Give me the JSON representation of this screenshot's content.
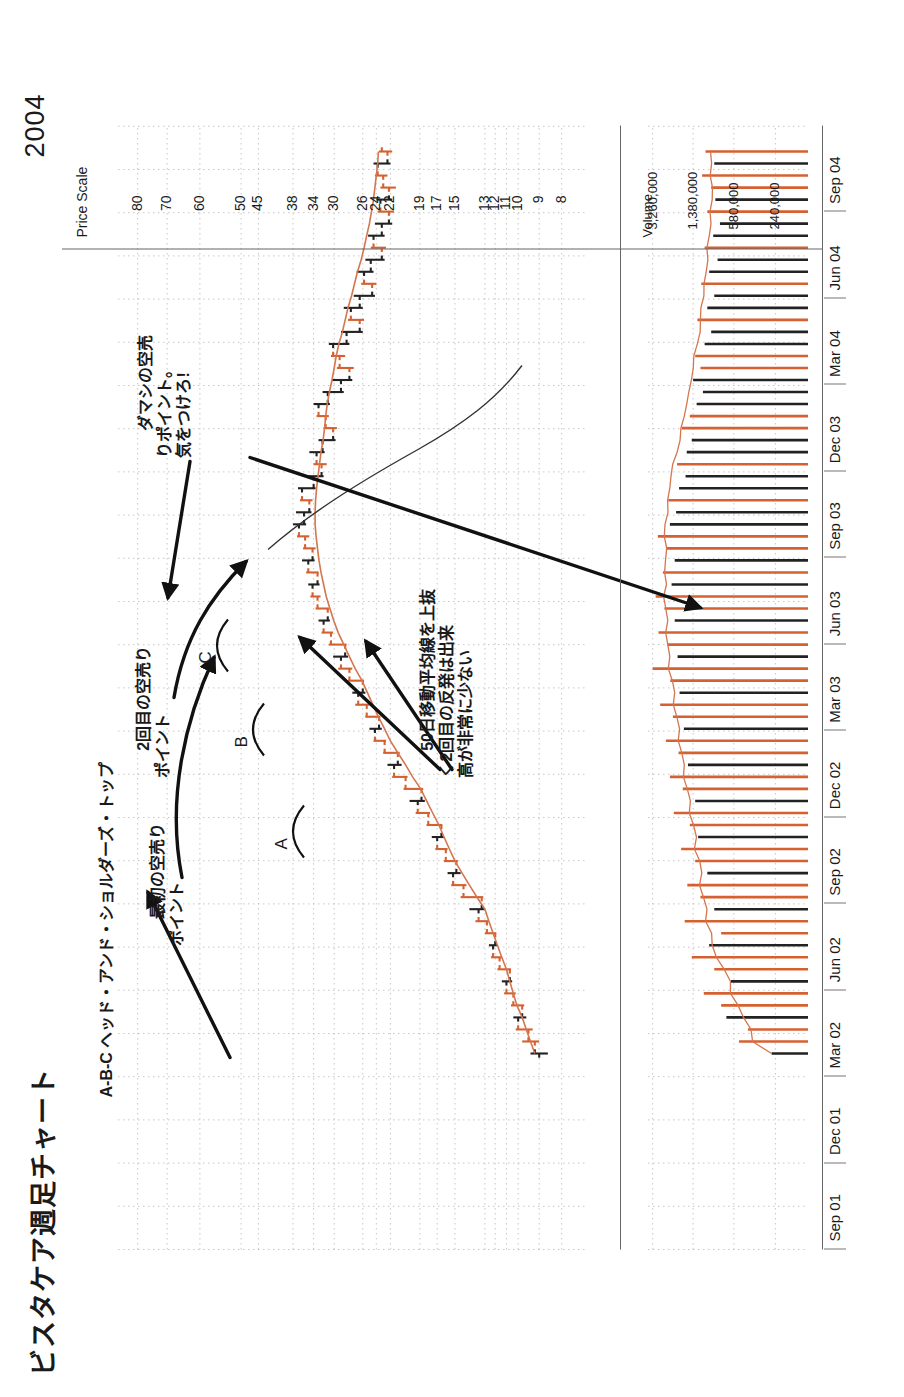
{
  "document": {
    "title": "ビスタケア週足チャート",
    "year_label": "2004"
  },
  "price_axis": {
    "caption": "Price Scale",
    "ticks": [
      "80",
      "70",
      "60",
      "50",
      "45",
      "38",
      "34",
      "30",
      "26",
      "24",
      "22",
      "19",
      "17",
      "15",
      "13",
      "12",
      "11",
      "10",
      "9",
      "8"
    ]
  },
  "volume_axis": {
    "caption": "Volume",
    "ticks": [
      "3,260,000",
      "1,380,000",
      "580,000",
      "240,000"
    ]
  },
  "date_axis": {
    "ticks": [
      "Sep 01",
      "Dec 01",
      "Mar 02",
      "Jun 02",
      "Sep 02",
      "Dec 02",
      "Mar 03",
      "Jun 03",
      "Sep 03",
      "Dec 03",
      "Mar 04",
      "Jun 04",
      "Sep 04"
    ]
  },
  "annotations": {
    "head_shoulders": "A-B-C ヘッド・アンド・ショルダーズ・トップ",
    "first_short": "最初の空売り\nポイント",
    "second_short": "2回目の空売り\nポイント",
    "ma_breakout": "50日移動平均線を上抜\nく2回目の反発は出来\n高が非常に少ない",
    "fake_short": "ダマシの空売\nりポイント。\n気をつけろ!",
    "peak_a": "A",
    "peak_b": "B",
    "peak_c": "C"
  },
  "colors": {
    "up_bar": "#d4612f",
    "down_bar": "#222222",
    "ma_line": "#d4764f",
    "grid": "#b9b9b9",
    "axis": "#555555",
    "text": "#1a1a1a"
  },
  "chart_data": {
    "type": "line",
    "title": "ビスタケア週足チャート",
    "xlabel": "",
    "ylabel": "Price Scale",
    "ylim": [
      8,
      90
    ],
    "grid": true,
    "legend": "none",
    "x": [
      "Sep 01",
      "Dec 01",
      "Mar 02",
      "Jun 02",
      "Sep 02",
      "Dec 02",
      "Mar 03",
      "Jun 03",
      "Sep 03",
      "Dec 03",
      "Mar 04",
      "Jun 04",
      "Sep 04"
    ],
    "price_series": {
      "name": "Weekly OHLC",
      "note": "Weekly bars begin around Dec 02 at ~9 and rally to ~38 by Mar 04 before rolling over to ~22 by Sep 04",
      "bars": [
        {
          "i": 0,
          "o": 9.0,
          "h": 9.4,
          "l": 8.6,
          "c": 9.2,
          "dir": "down"
        },
        {
          "i": 1,
          "o": 9.2,
          "h": 9.8,
          "l": 9.0,
          "c": 9.5,
          "dir": "up"
        },
        {
          "i": 2,
          "o": 9.5,
          "h": 10.2,
          "l": 9.3,
          "c": 10.0,
          "dir": "up"
        },
        {
          "i": 3,
          "o": 10.0,
          "h": 10.4,
          "l": 9.6,
          "c": 9.8,
          "dir": "down"
        },
        {
          "i": 4,
          "o": 9.8,
          "h": 10.6,
          "l": 9.7,
          "c": 10.4,
          "dir": "up"
        },
        {
          "i": 5,
          "o": 10.4,
          "h": 11.2,
          "l": 10.2,
          "c": 11.0,
          "dir": "up"
        },
        {
          "i": 6,
          "o": 11.0,
          "h": 11.4,
          "l": 10.5,
          "c": 10.7,
          "dir": "down"
        },
        {
          "i": 7,
          "o": 10.7,
          "h": 11.8,
          "l": 10.6,
          "c": 11.6,
          "dir": "up"
        },
        {
          "i": 8,
          "o": 11.6,
          "h": 12.4,
          "l": 11.4,
          "c": 12.2,
          "dir": "up"
        },
        {
          "i": 9,
          "o": 12.2,
          "h": 12.6,
          "l": 11.8,
          "c": 12.0,
          "dir": "down"
        },
        {
          "i": 10,
          "o": 12.0,
          "h": 13.0,
          "l": 11.9,
          "c": 12.8,
          "dir": "up"
        },
        {
          "i": 11,
          "o": 12.8,
          "h": 13.6,
          "l": 12.6,
          "c": 13.4,
          "dir": "up"
        },
        {
          "i": 12,
          "o": 13.4,
          "h": 14.0,
          "l": 13.0,
          "c": 13.2,
          "dir": "down"
        },
        {
          "i": 13,
          "o": 13.2,
          "h": 14.6,
          "l": 13.1,
          "c": 14.4,
          "dir": "up"
        },
        {
          "i": 14,
          "o": 14.4,
          "h": 15.4,
          "l": 14.2,
          "c": 15.2,
          "dir": "up"
        },
        {
          "i": 15,
          "o": 15.2,
          "h": 15.8,
          "l": 14.6,
          "c": 14.9,
          "dir": "down"
        },
        {
          "i": 16,
          "o": 14.9,
          "h": 16.2,
          "l": 14.8,
          "c": 16.0,
          "dir": "up"
        },
        {
          "i": 17,
          "o": 16.0,
          "h": 17.2,
          "l": 15.8,
          "c": 17.0,
          "dir": "up"
        },
        {
          "i": 18,
          "o": 17.0,
          "h": 17.6,
          "l": 16.2,
          "c": 16.5,
          "dir": "down"
        },
        {
          "i": 19,
          "o": 16.5,
          "h": 18.2,
          "l": 16.4,
          "c": 18.0,
          "dir": "up"
        },
        {
          "i": 20,
          "o": 18.0,
          "h": 19.4,
          "l": 17.8,
          "c": 19.2,
          "dir": "up"
        },
        {
          "i": 21,
          "o": 19.2,
          "h": 20.0,
          "l": 18.4,
          "c": 18.8,
          "dir": "down"
        },
        {
          "i": 22,
          "o": 18.8,
          "h": 20.6,
          "l": 18.6,
          "c": 20.4,
          "dir": "up"
        },
        {
          "i": 23,
          "o": 20.4,
          "h": 21.8,
          "l": 20.2,
          "c": 21.6,
          "dir": "up"
        },
        {
          "i": 24,
          "o": 21.6,
          "h": 22.4,
          "l": 20.8,
          "c": 21.2,
          "dir": "down"
        },
        {
          "i": 25,
          "o": 21.2,
          "h": 23.0,
          "l": 21.0,
          "c": 22.8,
          "dir": "up"
        },
        {
          "i": 26,
          "o": 22.8,
          "h": 24.4,
          "l": 22.6,
          "c": 24.2,
          "dir": "up"
        },
        {
          "i": 27,
          "o": 24.2,
          "h": 25.0,
          "l": 23.2,
          "c": 23.6,
          "dir": "down"
        },
        {
          "i": 28,
          "o": 23.6,
          "h": 25.6,
          "l": 23.4,
          "c": 25.4,
          "dir": "up"
        },
        {
          "i": 29,
          "o": 25.4,
          "h": 27.0,
          "l": 25.0,
          "c": 26.6,
          "dir": "up"
        },
        {
          "i": 30,
          "o": 26.6,
          "h": 27.4,
          "l": 25.6,
          "c": 26.0,
          "dir": "down"
        },
        {
          "i": 31,
          "o": 26.0,
          "h": 28.0,
          "l": 25.8,
          "c": 27.8,
          "dir": "up"
        },
        {
          "i": 32,
          "o": 27.8,
          "h": 29.4,
          "l": 27.4,
          "c": 29.0,
          "dir": "up"
        },
        {
          "i": 33,
          "o": 29.0,
          "h": 30.2,
          "l": 28.0,
          "c": 28.4,
          "dir": "down"
        },
        {
          "i": 34,
          "o": 28.4,
          "h": 31.0,
          "l": 28.2,
          "c": 30.6,
          "dir": "up"
        },
        {
          "i": 35,
          "o": 30.6,
          "h": 32.4,
          "l": 30.2,
          "c": 32.0,
          "dir": "up"
        },
        {
          "i": 36,
          "o": 32.0,
          "h": 33.0,
          "l": 30.8,
          "c": 31.2,
          "dir": "down"
        },
        {
          "i": 37,
          "o": 31.2,
          "h": 33.6,
          "l": 31.0,
          "c": 33.2,
          "dir": "up"
        },
        {
          "i": 38,
          "o": 33.2,
          "h": 34.6,
          "l": 32.6,
          "c": 34.2,
          "dir": "up"
        },
        {
          "i": 39,
          "o": 34.2,
          "h": 35.0,
          "l": 32.8,
          "c": 33.2,
          "dir": "down"
        },
        {
          "i": 40,
          "o": 33.2,
          "h": 35.4,
          "l": 33.0,
          "c": 35.0,
          "dir": "up"
        },
        {
          "i": 41,
          "o": 35.0,
          "h": 36.2,
          "l": 33.8,
          "c": 34.2,
          "dir": "down"
        },
        {
          "i": 42,
          "o": 34.2,
          "h": 36.0,
          "l": 33.6,
          "c": 35.6,
          "dir": "up"
        },
        {
          "i": 43,
          "o": 35.6,
          "h": 37.2,
          "l": 34.8,
          "c": 36.8,
          "dir": "up"
        },
        {
          "i": 44,
          "o": 36.8,
          "h": 38.0,
          "l": 35.4,
          "c": 35.8,
          "dir": "down"
        },
        {
          "i": 45,
          "o": 35.8,
          "h": 37.4,
          "l": 34.4,
          "c": 34.8,
          "dir": "down"
        },
        {
          "i": 46,
          "o": 34.8,
          "h": 36.6,
          "l": 34.2,
          "c": 36.2,
          "dir": "up"
        },
        {
          "i": 47,
          "o": 36.2,
          "h": 37.0,
          "l": 33.6,
          "c": 34.0,
          "dir": "down"
        },
        {
          "i": 48,
          "o": 34.0,
          "h": 35.2,
          "l": 32.0,
          "c": 32.4,
          "dir": "down"
        },
        {
          "i": 49,
          "o": 32.4,
          "h": 34.0,
          "l": 31.4,
          "c": 33.4,
          "dir": "up"
        },
        {
          "i": 50,
          "o": 33.4,
          "h": 34.8,
          "l": 31.8,
          "c": 32.2,
          "dir": "down"
        },
        {
          "i": 51,
          "o": 32.2,
          "h": 33.0,
          "l": 29.8,
          "c": 30.2,
          "dir": "down"
        },
        {
          "i": 52,
          "o": 30.2,
          "h": 32.0,
          "l": 29.6,
          "c": 31.6,
          "dir": "up"
        },
        {
          "i": 53,
          "o": 31.6,
          "h": 33.4,
          "l": 31.0,
          "c": 33.0,
          "dir": "up"
        },
        {
          "i": 54,
          "o": 33.0,
          "h": 34.0,
          "l": 30.8,
          "c": 31.2,
          "dir": "down"
        },
        {
          "i": 55,
          "o": 31.2,
          "h": 32.2,
          "l": 28.6,
          "c": 29.0,
          "dir": "down"
        },
        {
          "i": 56,
          "o": 29.0,
          "h": 30.4,
          "l": 27.4,
          "c": 27.8,
          "dir": "down"
        },
        {
          "i": 57,
          "o": 27.8,
          "h": 29.6,
          "l": 27.2,
          "c": 29.2,
          "dir": "up"
        },
        {
          "i": 58,
          "o": 29.2,
          "h": 30.6,
          "l": 28.4,
          "c": 30.2,
          "dir": "up"
        },
        {
          "i": 59,
          "o": 30.2,
          "h": 31.0,
          "l": 27.8,
          "c": 28.2,
          "dir": "down"
        },
        {
          "i": 60,
          "o": 28.2,
          "h": 29.0,
          "l": 26.0,
          "c": 26.4,
          "dir": "down"
        },
        {
          "i": 61,
          "o": 26.4,
          "h": 28.0,
          "l": 25.8,
          "c": 27.6,
          "dir": "up"
        },
        {
          "i": 62,
          "o": 27.6,
          "h": 28.6,
          "l": 26.0,
          "c": 26.4,
          "dir": "down"
        },
        {
          "i": 63,
          "o": 26.4,
          "h": 27.2,
          "l": 24.2,
          "c": 24.6,
          "dir": "down"
        },
        {
          "i": 64,
          "o": 24.6,
          "h": 26.2,
          "l": 24.0,
          "c": 25.8,
          "dir": "up"
        },
        {
          "i": 65,
          "o": 25.8,
          "h": 26.8,
          "l": 24.4,
          "c": 24.8,
          "dir": "down"
        },
        {
          "i": 66,
          "o": 24.8,
          "h": 25.6,
          "l": 22.8,
          "c": 23.2,
          "dir": "down"
        },
        {
          "i": 67,
          "o": 23.2,
          "h": 24.8,
          "l": 22.6,
          "c": 24.4,
          "dir": "up"
        },
        {
          "i": 68,
          "o": 24.4,
          "h": 25.2,
          "l": 22.8,
          "c": 23.2,
          "dir": "down"
        },
        {
          "i": 69,
          "o": 23.2,
          "h": 24.2,
          "l": 21.8,
          "c": 22.2,
          "dir": "down"
        },
        {
          "i": 70,
          "o": 22.2,
          "h": 23.8,
          "l": 21.6,
          "c": 23.4,
          "dir": "up"
        },
        {
          "i": 71,
          "o": 23.4,
          "h": 24.0,
          "l": 21.8,
          "c": 22.2,
          "dir": "down"
        },
        {
          "i": 72,
          "o": 22.2,
          "h": 23.4,
          "l": 21.4,
          "c": 23.0,
          "dir": "up"
        },
        {
          "i": 73,
          "o": 23.0,
          "h": 24.2,
          "l": 22.4,
          "c": 23.8,
          "dir": "up"
        },
        {
          "i": 74,
          "o": 23.8,
          "h": 24.4,
          "l": 22.0,
          "c": 22.4,
          "dir": "down"
        },
        {
          "i": 75,
          "o": 22.4,
          "h": 23.6,
          "l": 21.8,
          "c": 23.2,
          "dir": "up"
        }
      ]
    },
    "moving_average": {
      "name": "50-day moving average",
      "values": [
        9.2,
        9.4,
        9.6,
        9.8,
        10.1,
        10.4,
        10.7,
        11.0,
        11.4,
        11.8,
        12.2,
        12.6,
        13.0,
        13.5,
        14.0,
        14.5,
        15.0,
        15.6,
        16.2,
        16.8,
        17.5,
        18.2,
        18.9,
        19.7,
        20.4,
        21.2,
        22.0,
        22.8,
        23.7,
        24.5,
        25.3,
        26.1,
        27.0,
        27.8,
        28.6,
        29.4,
        30.1,
        30.8,
        31.5,
        32.0,
        32.5,
        32.9,
        33.2,
        33.5,
        33.7,
        33.7,
        33.6,
        33.4,
        33.1,
        32.8,
        32.5,
        32.1,
        31.8,
        31.6,
        31.3,
        30.9,
        30.4,
        30.0,
        29.7,
        29.3,
        28.8,
        28.4,
        28.0,
        27.5,
        27.1,
        26.7,
        26.2,
        25.8,
        25.4,
        25.0,
        24.7,
        24.4,
        24.2,
        24.0,
        23.8,
        23.7
      ]
    },
    "trend_line": {
      "name": "neckline / downtrend line",
      "note": "hand drawn descending line from the C shoulder area down to the right"
    },
    "volume_series": {
      "name": "Weekly Volume",
      "ylim": [
        0,
        3600000
      ],
      "ticks": [
        240000,
        580000,
        1380000,
        3260000
      ],
      "values": [
        260000,
        520000,
        430000,
        680000,
        760000,
        1100000,
        620000,
        880000,
        1420000,
        980000,
        760000,
        1650000,
        880000,
        1180000,
        1560000,
        1020000,
        1320000,
        1780000,
        1240000,
        1480000,
        2080000,
        1320000,
        1720000,
        2260000,
        1540000,
        1880000,
        2460000,
        1680000,
        2120000,
        2780000,
        1840000,
        2240000,
        3260000,
        1920000,
        2380000,
        2880000,
        2040000,
        2540000,
        3060000,
        2180000,
        2620000,
        2040000,
        2460000,
        2920000,
        2260000,
        1980000,
        2340000,
        1860000,
        1620000,
        1940000,
        1580000,
        1420000,
        1760000,
        1480000,
        1280000,
        1120000,
        1380000,
        1180000,
        1320000,
        1080000,
        940000,
        1260000,
        1020000,
        880000,
        1160000,
        980000,
        820000,
        1080000,
        900000,
        780000,
        1020000,
        860000,
        940000,
        1140000,
        880000,
        1060000
      ]
    }
  }
}
